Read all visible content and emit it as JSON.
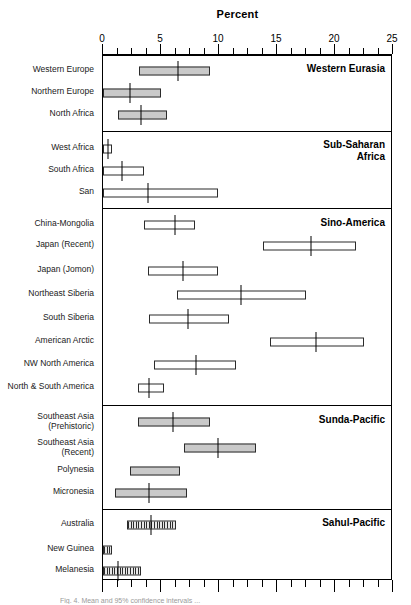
{
  "chart_data": {
    "type": "bar",
    "title": "Percent",
    "xlabel": "Percent",
    "ylabel": "",
    "xlim": [
      0,
      25
    ],
    "xticks": [
      0,
      5,
      10,
      15,
      20,
      25
    ],
    "xtick_labels": [
      "0",
      "5",
      "10",
      "15",
      "20",
      "25"
    ],
    "minor_tick_step": 1.25,
    "grid": false,
    "legend": null,
    "orientation": "horizontal",
    "note": "Horizontal range bars (box = range, vertical tick = central/median value) grouped by region.",
    "groups": [
      {
        "name": "Western Eurasia",
        "label": "Western Eurasia",
        "rows": [
          {
            "category": "Western Europe",
            "low": 3.1,
            "high": 9.2,
            "median": 6.5,
            "fill": "solid"
          },
          {
            "category": "Northern Europe",
            "low": 0.0,
            "high": 5.0,
            "median": 2.3,
            "fill": "solid"
          },
          {
            "category": "North Africa",
            "low": 1.3,
            "high": 5.5,
            "median": 3.3,
            "fill": "solid"
          }
        ]
      },
      {
        "name": "Sub-Saharan Africa",
        "label": "Sub-Saharan\nAfrica",
        "rows": [
          {
            "category": "West Africa",
            "low": 0.0,
            "high": 0.8,
            "median": 0.4,
            "fill": "open"
          },
          {
            "category": "South Africa",
            "low": 0.0,
            "high": 3.5,
            "median": 1.6,
            "fill": "open"
          },
          {
            "category": "San",
            "low": 0.0,
            "high": 9.9,
            "median": 3.9,
            "fill": "open"
          }
        ]
      },
      {
        "name": "Sino-America",
        "label": "Sino-America",
        "rows": [
          {
            "category": "China-Mongolia",
            "low": 3.5,
            "high": 7.9,
            "median": 6.2,
            "fill": "open"
          },
          {
            "category": "Japan (Recent)",
            "low": 13.8,
            "high": 21.8,
            "median": 17.9,
            "fill": "open"
          },
          {
            "category": "Japan (Jomon)",
            "low": 3.9,
            "high": 9.9,
            "median": 6.9,
            "fill": "open"
          },
          {
            "category": "Northeast Siberia",
            "low": 6.4,
            "high": 17.5,
            "median": 11.9,
            "fill": "open"
          },
          {
            "category": "South Siberia",
            "low": 4.0,
            "high": 10.9,
            "median": 7.3,
            "fill": "open"
          },
          {
            "category": "American Arctic",
            "low": 14.4,
            "high": 22.5,
            "median": 18.4,
            "fill": "open"
          },
          {
            "category": "NW North America",
            "low": 4.4,
            "high": 11.5,
            "median": 8.0,
            "fill": "open"
          },
          {
            "category": "North & South America",
            "low": 3.0,
            "high": 5.3,
            "median": 4.0,
            "fill": "open"
          }
        ]
      },
      {
        "name": "Sunda-Pacific",
        "label": "Sunda-Pacific",
        "rows": [
          {
            "category": "Southeast Asia\n(Prehistoric)",
            "low": 3.0,
            "high": 9.2,
            "median": 6.0,
            "fill": "solid"
          },
          {
            "category": "Southeast Asia\n(Recent)",
            "low": 7.0,
            "high": 13.2,
            "median": 9.9,
            "fill": "solid"
          },
          {
            "category": "Polynesia",
            "low": 2.3,
            "high": 6.6,
            "median": null,
            "fill": "solid"
          },
          {
            "category": "Micronesia",
            "low": 1.0,
            "high": 7.2,
            "median": 4.0,
            "fill": "solid"
          }
        ]
      },
      {
        "name": "Sahul-Pacific",
        "label": "Sahul-Pacific",
        "rows": [
          {
            "category": "Australia",
            "low": 2.1,
            "high": 6.3,
            "median": 4.1,
            "fill": "hatch"
          },
          {
            "category": "New Guinea",
            "low": 0.0,
            "high": 0.8,
            "median": null,
            "fill": "hatch"
          },
          {
            "category": "Melanesia",
            "low": 0.0,
            "high": 3.3,
            "median": 1.3,
            "fill": "hatch"
          }
        ]
      }
    ]
  },
  "caption": "Fig. 4.  Mean and 95% confidence intervals ..."
}
